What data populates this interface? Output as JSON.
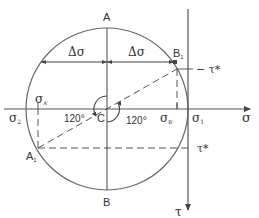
{
  "diagram": {
    "type": "mohr-circle",
    "colors": {
      "stroke": "#555555",
      "text": "#333333",
      "background": "#ffffff"
    },
    "points": {
      "top": "A",
      "bottom": "B",
      "center": "C",
      "a1": "A",
      "a1_sub": "1",
      "b1": "B",
      "b1_sub": "1"
    },
    "axes": {
      "sigma_axis": "σ",
      "tau_axis": "τ"
    },
    "labels": {
      "delta_sigma_left": "Δσ",
      "delta_sigma_right": "Δσ",
      "neg_tau_star": "− τ*",
      "tau_star": "τ*",
      "sigma_1": "σ",
      "sigma_1_sub": "1",
      "sigma_2": "σ",
      "sigma_2_sub": "2",
      "sigma_a_prime": "σ",
      "sigma_a_prime_sub": "A'",
      "sigma_b_prime": "σ",
      "sigma_b_prime_sub": "B'",
      "angle_left": "120°",
      "angle_right": "120°"
    }
  }
}
